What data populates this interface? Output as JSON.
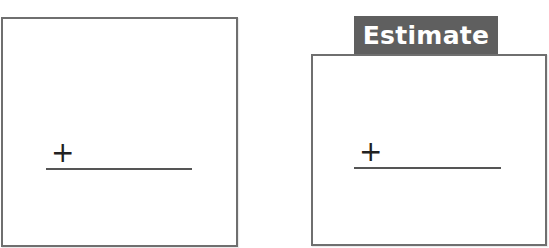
{
  "panels": [
    {
      "id": "left",
      "tab_label": null,
      "symbol": "+",
      "has_answer_line": true
    },
    {
      "id": "right",
      "tab_label": "Estimate",
      "symbol": "+",
      "has_answer_line": true
    }
  ],
  "colors": {
    "border": "#6f6f6f",
    "tab_background": "#5f5f5f",
    "tab_text": "#ffffff",
    "line": "#555555"
  }
}
